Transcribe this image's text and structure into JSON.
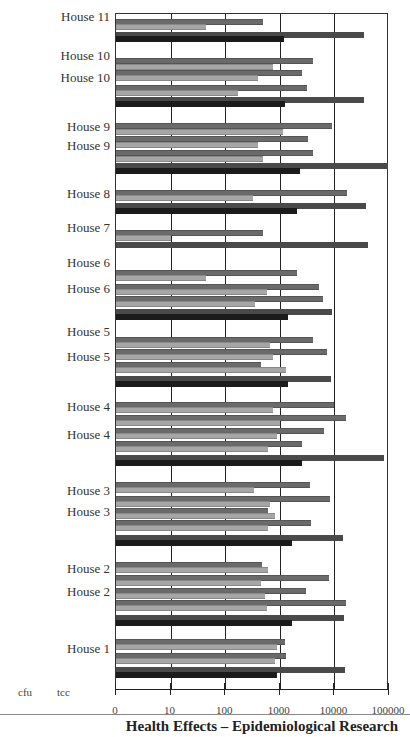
{
  "chart_data": {
    "type": "bar",
    "orientation": "horizontal",
    "xscale": "log",
    "xlabel": "",
    "ylabel": "",
    "x_ticks": [
      "0",
      "10",
      "100",
      "1000",
      "10000",
      "100000"
    ],
    "xlim": [
      1,
      100000
    ],
    "grid": true,
    "legend": [
      "cfu",
      "tcc"
    ],
    "legend_position": "bottom-left",
    "categories_top_to_bottom": [
      "House 11",
      "House 10",
      "House 10",
      "House 9",
      "House 9",
      "House 8",
      "House 7",
      "House 6",
      "House 6",
      "House 5",
      "House 5",
      "House 4",
      "House 4",
      "House 3",
      "House 3",
      "House 2",
      "House 2",
      "House 1"
    ],
    "bars": [
      {
        "group": "House 11",
        "y": 18,
        "kind": "dark",
        "value": 500
      },
      {
        "group": "House 11",
        "y": 23,
        "kind": "light",
        "value": 45
      },
      {
        "group": "House 11",
        "y": 31,
        "kind": "tccdark",
        "value": 35000
      },
      {
        "group": "House 11",
        "y": 35,
        "kind": "black",
        "value": 1200
      },
      {
        "group": "House 10",
        "y": 57,
        "kind": "dark",
        "value": 4000
      },
      {
        "group": "House 10",
        "y": 63,
        "kind": "light",
        "value": 750
      },
      {
        "group": "House 10",
        "y": 69,
        "kind": "dark",
        "value": 2500
      },
      {
        "group": "House 10",
        "y": 74,
        "kind": "light",
        "value": 400
      },
      {
        "group": "House 10",
        "y": 84,
        "kind": "dark",
        "value": 3200
      },
      {
        "group": "House 10",
        "y": 89,
        "kind": "light",
        "value": 170
      },
      {
        "group": "House 10",
        "y": 96,
        "kind": "tccdark",
        "value": 35000
      },
      {
        "group": "House 10",
        "y": 100,
        "kind": "black",
        "value": 1250
      },
      {
        "group": "House 9",
        "y": 122,
        "kind": "dark",
        "value": 9000
      },
      {
        "group": "House 9",
        "y": 128,
        "kind": "light",
        "value": 1150
      },
      {
        "group": "House 9",
        "y": 135,
        "kind": "dark",
        "value": 3300
      },
      {
        "group": "House 9",
        "y": 141,
        "kind": "light",
        "value": 400
      },
      {
        "group": "House 9",
        "y": 149,
        "kind": "dark",
        "value": 4000
      },
      {
        "group": "House 9",
        "y": 155,
        "kind": "light",
        "value": 500
      },
      {
        "group": "House 9",
        "y": 162,
        "kind": "tccdark",
        "value": 100000
      },
      {
        "group": "House 9",
        "y": 167,
        "kind": "black",
        "value": 2300
      },
      {
        "group": "House 8",
        "y": 189,
        "kind": "dark",
        "value": 17000
      },
      {
        "group": "House 8",
        "y": 194,
        "kind": "light",
        "value": 320
      },
      {
        "group": "House 8",
        "y": 202,
        "kind": "tccdark",
        "value": 38000
      },
      {
        "group": "House 8",
        "y": 207,
        "kind": "black",
        "value": 2100
      },
      {
        "group": "House 7",
        "y": 229,
        "kind": "dark",
        "value": 500
      },
      {
        "group": "House 7",
        "y": 234,
        "kind": "light",
        "value": 10
      },
      {
        "group": "House 7",
        "y": 241,
        "kind": "tccdark",
        "value": 42000
      },
      {
        "group": "House 6",
        "y": 269,
        "kind": "dark",
        "value": 2100
      },
      {
        "group": "House 6",
        "y": 274,
        "kind": "light",
        "value": 45
      },
      {
        "group": "House 6",
        "y": 283,
        "kind": "dark",
        "value": 5200
      },
      {
        "group": "House 6",
        "y": 288,
        "kind": "light",
        "value": 580
      },
      {
        "group": "House 6",
        "y": 295,
        "kind": "dark",
        "value": 6200
      },
      {
        "group": "House 6",
        "y": 300,
        "kind": "light",
        "value": 350
      },
      {
        "group": "House 6",
        "y": 308,
        "kind": "tccdark",
        "value": 9000
      },
      {
        "group": "House 6",
        "y": 313,
        "kind": "black",
        "value": 1400
      },
      {
        "group": "House 5",
        "y": 336,
        "kind": "dark",
        "value": 4000
      },
      {
        "group": "House 5",
        "y": 341,
        "kind": "light",
        "value": 650
      },
      {
        "group": "House 5",
        "y": 348,
        "kind": "dark",
        "value": 7200
      },
      {
        "group": "House 5",
        "y": 353,
        "kind": "light",
        "value": 750
      },
      {
        "group": "House 5",
        "y": 361,
        "kind": "dark",
        "value": 450
      },
      {
        "group": "House 5",
        "y": 366,
        "kind": "light",
        "value": 1300
      },
      {
        "group": "House 5",
        "y": 375,
        "kind": "tccdark",
        "value": 8800
      },
      {
        "group": "House 5",
        "y": 380,
        "kind": "black",
        "value": 1400
      },
      {
        "group": "House 4",
        "y": 401,
        "kind": "dark",
        "value": 10000
      },
      {
        "group": "House 4",
        "y": 406,
        "kind": "light",
        "value": 750
      },
      {
        "group": "House 4",
        "y": 414,
        "kind": "dark",
        "value": 16000
      },
      {
        "group": "House 4",
        "y": 419,
        "kind": "light",
        "value": 1000
      },
      {
        "group": "House 4",
        "y": 427,
        "kind": "dark",
        "value": 6500
      },
      {
        "group": "House 4",
        "y": 432,
        "kind": "light",
        "value": 900
      },
      {
        "group": "House 4",
        "y": 440,
        "kind": "dark",
        "value": 2500
      },
      {
        "group": "House 4",
        "y": 445,
        "kind": "light",
        "value": 600
      },
      {
        "group": "House 4",
        "y": 454,
        "kind": "tccdark",
        "value": 80000
      },
      {
        "group": "House 4",
        "y": 459,
        "kind": "black",
        "value": 2500
      },
      {
        "group": "House 3",
        "y": 481,
        "kind": "dark",
        "value": 3500
      },
      {
        "group": "House 3",
        "y": 486,
        "kind": "light",
        "value": 330
      },
      {
        "group": "House 3",
        "y": 495,
        "kind": "dark",
        "value": 8200
      },
      {
        "group": "House 3",
        "y": 500,
        "kind": "light",
        "value": 650
      },
      {
        "group": "House 3",
        "y": 507,
        "kind": "dark",
        "value": 600
      },
      {
        "group": "House 3",
        "y": 512,
        "kind": "light",
        "value": 820
      },
      {
        "group": "House 3",
        "y": 519,
        "kind": "dark",
        "value": 3700
      },
      {
        "group": "House 3",
        "y": 524,
        "kind": "light",
        "value": 600
      },
      {
        "group": "House 3",
        "y": 534,
        "kind": "tccdark",
        "value": 14500
      },
      {
        "group": "House 3",
        "y": 539,
        "kind": "black",
        "value": 1700
      },
      {
        "group": "House 2",
        "y": 561,
        "kind": "dark",
        "value": 480
      },
      {
        "group": "House 2",
        "y": 566,
        "kind": "light",
        "value": 620
      },
      {
        "group": "House 2",
        "y": 574,
        "kind": "dark",
        "value": 7800
      },
      {
        "group": "House 2",
        "y": 579,
        "kind": "light",
        "value": 460
      },
      {
        "group": "House 2",
        "y": 587,
        "kind": "dark",
        "value": 3000
      },
      {
        "group": "House 2",
        "y": 592,
        "kind": "light",
        "value": 530
      },
      {
        "group": "House 2",
        "y": 599,
        "kind": "dark",
        "value": 16500
      },
      {
        "group": "House 2",
        "y": 604,
        "kind": "light",
        "value": 580
      },
      {
        "group": "House 2",
        "y": 614,
        "kind": "tccdark",
        "value": 15000
      },
      {
        "group": "House 2",
        "y": 619,
        "kind": "black",
        "value": 1650
      },
      {
        "group": "House 1",
        "y": 638,
        "kind": "dark",
        "value": 1250
      },
      {
        "group": "House 1",
        "y": 643,
        "kind": "light",
        "value": 900
      },
      {
        "group": "House 1",
        "y": 652,
        "kind": "dark",
        "value": 1300
      },
      {
        "group": "House 1",
        "y": 657,
        "kind": "light",
        "value": 800
      },
      {
        "group": "House 1",
        "y": 666,
        "kind": "tccdark",
        "value": 15500
      },
      {
        "group": "House 1",
        "y": 671,
        "kind": "black",
        "value": 900
      }
    ]
  },
  "labels": [
    {
      "text": "House 11",
      "y": 18
    },
    {
      "text": "House 10",
      "y": 57
    },
    {
      "text": "House 10",
      "y": 79
    },
    {
      "text": "House 9",
      "y": 128
    },
    {
      "text": "House 9",
      "y": 147
    },
    {
      "text": "House 8",
      "y": 195
    },
    {
      "text": "House 7",
      "y": 229
    },
    {
      "text": "House 6",
      "y": 264
    },
    {
      "text": "House 6",
      "y": 290
    },
    {
      "text": "House 5",
      "y": 333
    },
    {
      "text": "House 5",
      "y": 358
    },
    {
      "text": "House 4",
      "y": 408
    },
    {
      "text": "House 4",
      "y": 436
    },
    {
      "text": "House 3",
      "y": 492
    },
    {
      "text": "House 3",
      "y": 513
    },
    {
      "text": "House 2",
      "y": 570
    },
    {
      "text": "House 2",
      "y": 593
    },
    {
      "text": "House 1",
      "y": 650
    }
  ],
  "legend": {
    "cfu": "cfu",
    "tcc": "tcc"
  },
  "footer": "Health Effects – Epidemiological Research",
  "colors": {
    "dark": "#6a6a6a",
    "light": "#a6a6a6",
    "black": "#1b1b1b",
    "tccdark": "#4a4a4a"
  }
}
